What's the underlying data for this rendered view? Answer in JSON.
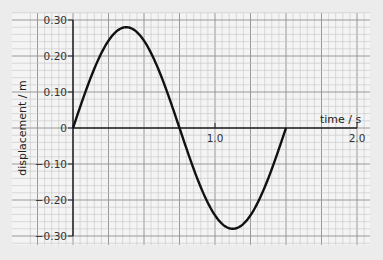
{
  "chart_data": {
    "type": "line",
    "title": "",
    "xlabel": "time / s",
    "ylabel": "displacement / m",
    "xlim": [
      -0.23,
      2.1
    ],
    "ylim": [
      -0.32,
      0.32
    ],
    "x_ticks": [
      {
        "value": 1.0,
        "label": "1.0"
      },
      {
        "value": 2.0,
        "label": "2.0"
      }
    ],
    "y_ticks": [
      {
        "value": 0.3,
        "label": "0.30"
      },
      {
        "value": 0.2,
        "label": "0.20"
      },
      {
        "value": 0.1,
        "label": "0.10"
      },
      {
        "value": 0,
        "label": "0"
      },
      {
        "value": -0.1,
        "label": "−0.10"
      },
      {
        "value": -0.2,
        "label": "−0.20"
      },
      {
        "value": -0.3,
        "label": "−0.30"
      }
    ],
    "grid": true,
    "legend": null,
    "series": [
      {
        "name": "displacement",
        "function": "0.28*sin(2*pi*t/1.5)",
        "amplitude": 0.28,
        "period": 1.5,
        "x": [
          0,
          0.125,
          0.25,
          0.375,
          0.5,
          0.625,
          0.75,
          0.875,
          1.0,
          1.125,
          1.25,
          1.375,
          1.5
        ],
        "y": [
          0,
          0.14,
          0.242,
          0.28,
          0.242,
          0.14,
          0,
          -0.14,
          -0.242,
          -0.28,
          -0.242,
          -0.14,
          0
        ]
      }
    ],
    "colors": {
      "background": "#f4f4f4",
      "grid_minor": "#c4c4c4",
      "grid_major": "#8e8e8e",
      "axis": "#222222",
      "curve": "#111111"
    }
  }
}
